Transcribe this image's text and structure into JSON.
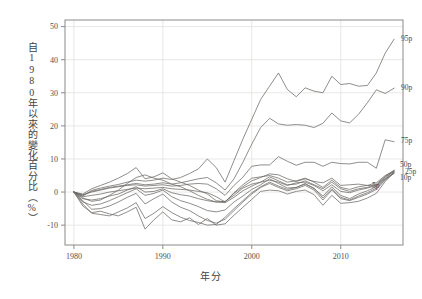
{
  "chart_data": {
    "type": "line",
    "title": "",
    "xlabel": "年分",
    "ylabel": "自1980年以來的變化百分比（%）",
    "xlim": [
      1979,
      2017
    ],
    "ylim": [
      -16,
      52
    ],
    "xticks": [
      1980,
      1990,
      2000,
      2010
    ],
    "xtick_labels": [
      "1980",
      "1990",
      "2000",
      "2010"
    ],
    "yticks": [
      -10,
      0,
      10,
      20,
      30,
      40,
      50
    ],
    "ytick_labels": [
      "-10",
      "0",
      "10",
      "20",
      "30",
      "40",
      "50"
    ],
    "grid": true,
    "legend_position": "right-inline-labels",
    "line_color": "#6b6866",
    "grid_color": "#e3e1df",
    "axis_color": "#8c8a88",
    "x": [
      1980,
      1981,
      1982,
      1983,
      1984,
      1985,
      1986,
      1987,
      1988,
      1989,
      1990,
      1991,
      1992,
      1993,
      1994,
      1995,
      1996,
      1997,
      1998,
      1999,
      2000,
      2001,
      2002,
      2003,
      2004,
      2005,
      2006,
      2007,
      2008,
      2009,
      2010,
      2011,
      2012,
      2013,
      2014,
      2015,
      2016
    ],
    "series": [
      {
        "name": "95p",
        "label": "95p",
        "label_value": 46.2,
        "values": [
          0,
          -1.2,
          0.5,
          1.2,
          1.8,
          2.3,
          3.0,
          3.6,
          3.3,
          3.6,
          4.2,
          3.8,
          4.4,
          5.6,
          7.0,
          10.0,
          7.4,
          3.0,
          9.5,
          16.0,
          22.0,
          28.0,
          32.0,
          36.0,
          31.0,
          28.8,
          31.5,
          30.5,
          30.0,
          35.0,
          32.5,
          32.8,
          32.0,
          32.2,
          36.0,
          42.0,
          46.2
        ]
      },
      {
        "name": "90p",
        "label": "90p",
        "label_value": 31.4,
        "values": [
          0,
          -1.0,
          0.2,
          0.8,
          1.4,
          1.8,
          2.2,
          2.6,
          2.2,
          2.4,
          2.8,
          2.4,
          2.8,
          3.4,
          4.0,
          4.4,
          2.8,
          0.6,
          4.0,
          9.0,
          14.5,
          19.5,
          22.3,
          20.6,
          20.2,
          20.4,
          20.2,
          19.5,
          20.8,
          23.9,
          21.5,
          20.9,
          23.5,
          27.0,
          30.9,
          29.8,
          31.4
        ]
      },
      {
        "name": "75p",
        "label": "75p",
        "label_value": 15.8,
        "values": [
          0,
          -0.8,
          0.0,
          0.6,
          1.2,
          1.6,
          2.0,
          2.2,
          1.8,
          2.0,
          2.2,
          1.8,
          2.0,
          2.4,
          2.6,
          2.4,
          1.0,
          -1.0,
          2.0,
          4.5,
          7.8,
          8.2,
          8.2,
          10.7,
          9.3,
          8.1,
          9.0,
          9.0,
          7.8,
          9.0,
          8.6,
          8.5,
          9.0,
          9.0,
          7.2,
          15.8,
          15.2
        ]
      },
      {
        "name": "50p",
        "label": "50p",
        "label_value": 6.6,
        "values": [
          0,
          -1.4,
          -1.0,
          -0.6,
          0.0,
          0.4,
          0.8,
          1.2,
          1.0,
          1.2,
          1.4,
          1.0,
          0.8,
          0.6,
          0.2,
          -0.2,
          -1.4,
          -3.0,
          -0.4,
          1.6,
          3.4,
          4.4,
          5.5,
          5.2,
          4.0,
          3.2,
          4.0,
          3.2,
          2.8,
          4.2,
          2.0,
          2.2,
          2.4,
          2.0,
          1.8,
          4.8,
          6.6
        ]
      },
      {
        "name": "25p",
        "label": "25p",
        "label_value": 6.2,
        "values": [
          0,
          -2.0,
          -2.4,
          -2.0,
          -1.2,
          -0.6,
          0.6,
          1.6,
          0.0,
          0.2,
          1.0,
          -0.2,
          -0.8,
          -1.2,
          -2.0,
          -2.6,
          -3.0,
          -3.2,
          -1.6,
          0.4,
          1.8,
          3.0,
          4.6,
          3.4,
          2.2,
          2.4,
          3.4,
          2.2,
          1.0,
          3.0,
          1.0,
          0.2,
          1.0,
          1.4,
          2.4,
          4.6,
          6.2
        ]
      },
      {
        "name": "10p",
        "label": "10p",
        "label_value": 5.6,
        "values": [
          0,
          -3.0,
          -4.0,
          -3.6,
          -2.6,
          -1.4,
          -0.2,
          1.0,
          -1.0,
          -0.4,
          0.6,
          -1.4,
          -2.6,
          -3.4,
          -4.4,
          -5.6,
          -6.0,
          -5.4,
          -3.0,
          -1.2,
          0.8,
          2.2,
          4.0,
          2.6,
          1.2,
          1.4,
          2.6,
          1.0,
          -1.2,
          1.6,
          -1.0,
          -2.0,
          -0.6,
          0.4,
          1.6,
          4.0,
          5.6
        ]
      },
      {
        "name": "5p",
        "label": "5p",
        "label_value": 6.0,
        "values": [
          0,
          -4.2,
          -6.2,
          -5.8,
          -6.6,
          -7.2,
          -6.0,
          -4.6,
          -11.2,
          -8.4,
          -6.0,
          -8.4,
          -9.0,
          -7.8,
          -9.8,
          -8.0,
          -10.0,
          -9.6,
          -7.0,
          -4.6,
          -2.2,
          0.2,
          0.6,
          0.4,
          -0.6,
          0.2,
          0.6,
          -0.8,
          -4.0,
          -1.0,
          -3.4,
          -3.2,
          -2.8,
          -1.8,
          -0.4,
          3.2,
          6.0
        ]
      },
      {
        "name": "extra-mid",
        "label": "",
        "label_value": 0,
        "values": [
          0,
          -1.8,
          -2.8,
          -2.4,
          -1.0,
          0.6,
          2.6,
          4.4,
          5.2,
          4.2,
          3.6,
          2.4,
          1.6,
          0.4,
          -1.0,
          -2.2,
          -3.0,
          -2.8,
          -1.0,
          1.2,
          2.4,
          3.0,
          3.6,
          3.0,
          2.0,
          2.8,
          3.0,
          2.0,
          0.4,
          2.2,
          0.2,
          -0.2,
          0.6,
          1.2,
          2.0,
          4.2,
          6.4
        ]
      },
      {
        "name": "extra-upper",
        "label": "",
        "label_value": 0,
        "values": [
          0,
          -0.6,
          1.0,
          2.0,
          3.0,
          4.2,
          5.6,
          7.4,
          4.0,
          4.6,
          5.8,
          4.0,
          3.0,
          2.0,
          0.6,
          -0.6,
          -2.6,
          -3.0,
          -0.2,
          2.2,
          4.2,
          4.6,
          5.0,
          4.2,
          3.0,
          3.4,
          4.2,
          3.0,
          1.4,
          3.6,
          1.4,
          0.8,
          1.6,
          2.0,
          2.8,
          5.0,
          6.4
        ]
      },
      {
        "name": "extra-low",
        "label": "",
        "label_value": 0,
        "values": [
          0,
          -2.6,
          -5.2,
          -5.0,
          -4.2,
          -3.0,
          -1.6,
          -0.4,
          -3.6,
          -2.0,
          -0.6,
          -3.0,
          -4.6,
          -5.6,
          -7.2,
          -8.6,
          -9.4,
          -8.2,
          -5.6,
          -3.0,
          -0.6,
          1.4,
          2.6,
          1.4,
          0.4,
          1.0,
          2.0,
          0.6,
          -2.4,
          0.6,
          -2.0,
          -2.6,
          -1.6,
          -0.6,
          0.8,
          3.6,
          5.8
        ]
      },
      {
        "name": "extra-low2",
        "label": "",
        "label_value": 0,
        "values": [
          0,
          -3.6,
          -6.4,
          -6.8,
          -7.2,
          -6.0,
          -4.8,
          -3.2,
          -8.0,
          -6.4,
          -4.4,
          -6.2,
          -7.6,
          -8.6,
          -9.2,
          -10.0,
          -9.8,
          -7.6,
          -5.0,
          -2.6,
          -0.2,
          1.6,
          3.0,
          1.8,
          0.8,
          1.4,
          2.4,
          1.2,
          -1.8,
          1.0,
          -1.6,
          -2.4,
          -1.2,
          -0.2,
          1.2,
          3.8,
          6.0
        ]
      }
    ]
  }
}
